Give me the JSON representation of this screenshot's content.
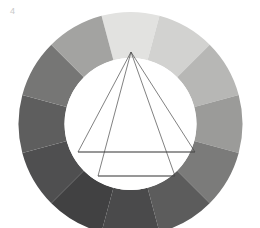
{
  "figure": {
    "label": "4",
    "label_color": "#c9c9c9",
    "title": "Twelve-part grayscale color wheel with inscribed triangles",
    "background_color": "#ffffff",
    "canvas": {
      "width": 260,
      "height": 228
    }
  },
  "wheel": {
    "center_x": 130.5,
    "center_y": 124,
    "outer_radius": 112,
    "inner_radius": 66,
    "segment_count": 12,
    "segment_angle_deg": 30,
    "inner_fill": "#ffffff",
    "segments": [
      {
        "index": 1,
        "position": "top",
        "start_deg": -15,
        "end_deg": 15,
        "color": "#e2e2e0"
      },
      {
        "index": 2,
        "position": "top-right",
        "start_deg": 15,
        "end_deg": 45,
        "color": "#d2d2d0"
      },
      {
        "index": 3,
        "position": "upper-right",
        "start_deg": 45,
        "end_deg": 75,
        "color": "#b7b7b5"
      },
      {
        "index": 4,
        "position": "right",
        "start_deg": 75,
        "end_deg": 105,
        "color": "#9b9b99"
      },
      {
        "index": 5,
        "position": "lower-right",
        "start_deg": 105,
        "end_deg": 135,
        "color": "#7b7b7a"
      },
      {
        "index": 6,
        "position": "bottom-right",
        "start_deg": 135,
        "end_deg": 165,
        "color": "#5c5c5c"
      },
      {
        "index": 7,
        "position": "bottom",
        "start_deg": 165,
        "end_deg": 195,
        "color": "#4a4a4b"
      },
      {
        "index": 8,
        "position": "bottom-left",
        "start_deg": 195,
        "end_deg": 225,
        "color": "#414142"
      },
      {
        "index": 9,
        "position": "lower-left",
        "start_deg": 225,
        "end_deg": 255,
        "color": "#4f4f50"
      },
      {
        "index": 10,
        "position": "left",
        "start_deg": 255,
        "end_deg": 285,
        "color": "#5e5e5e"
      },
      {
        "index": 11,
        "position": "upper-left",
        "start_deg": 285,
        "end_deg": 315,
        "color": "#767675"
      },
      {
        "index": 12,
        "position": "top-left",
        "start_deg": 315,
        "end_deg": 345,
        "color": "#a3a3a1"
      }
    ]
  },
  "overlay": {
    "stroke_color": "#4a4a4a",
    "stroke_width": 0.7,
    "apex": {
      "x": 131,
      "y": 52
    },
    "outer_triangle": {
      "name": "primary-triangle",
      "points": "131,52 78,152 195,152"
    },
    "inner_triangle": {
      "name": "secondary-triangle",
      "points": "131,52 98,176 175,176"
    },
    "base_lines": [
      {
        "name": "outer-base-line",
        "x1": 78,
        "y1": 152,
        "x2": 195,
        "y2": 152
      },
      {
        "name": "inner-base-line",
        "x1": 98,
        "y1": 176,
        "x2": 175,
        "y2": 176
      }
    ]
  }
}
